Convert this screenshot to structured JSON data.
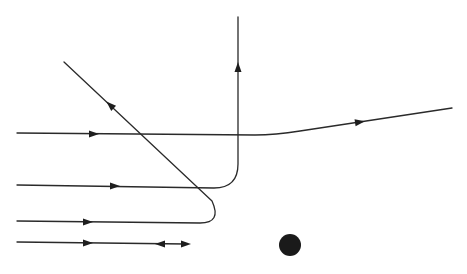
{
  "diagram": {
    "title": "",
    "colors": {
      "line": "#2a2a2a",
      "target": "#1a1a1a",
      "background": "#ffffff"
    },
    "target": {
      "name": "scattering-center",
      "cx": 290,
      "cy": 245,
      "r": 11
    },
    "trajectories": [
      {
        "name": "trajectory-large-impact-parameter",
        "label": "small deflection",
        "path": "M 17 133 L 255 135 Q 275 135 300 131 L 452 108",
        "arrows": [
          {
            "x": 94,
            "y": 134,
            "angle": 0
          },
          {
            "x": 360,
            "y": 122,
            "angle": -8.6
          }
        ]
      },
      {
        "name": "trajectory-right-angle",
        "label": "90 degree deflection",
        "path": "M 17 185 L 214 188 Q 238 188 238 164 L 238 17",
        "arrows": [
          {
            "x": 115,
            "y": 186,
            "angle": 0
          },
          {
            "x": 238,
            "y": 67,
            "angle": -90
          }
        ]
      },
      {
        "name": "trajectory-back-scatter",
        "label": "large-angle back scattering",
        "path": "M 17 221 L 200 223 Q 222 223 212 201 L 64 62",
        "arrows": [
          {
            "x": 88,
            "y": 222,
            "angle": 0
          },
          {
            "x": 110,
            "y": 105,
            "angle": -136.8
          }
        ]
      },
      {
        "name": "trajectory-head-on",
        "label": "head-on collision, reverses",
        "path": "M 17 242 L 186 244",
        "arrows": [
          {
            "x": 88,
            "y": 243,
            "angle": 0
          },
          {
            "x": 160,
            "y": 244,
            "angle": 180
          },
          {
            "x": 186,
            "y": 244,
            "angle": 0
          }
        ]
      }
    ]
  }
}
